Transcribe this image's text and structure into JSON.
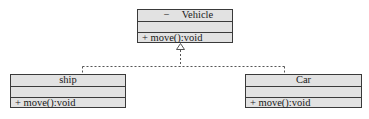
{
  "diagram": {
    "type": "uml-class-diagram",
    "relationship": "realization",
    "colors": {
      "box_fill": "#e2e2e2",
      "box_border": "#3a3a3a",
      "connector": "#555555"
    },
    "classes": [
      {
        "id": "vehicle",
        "visibility": "−",
        "name": "Vehicle",
        "attributes": [],
        "operations": [
          "+ move():void"
        ]
      },
      {
        "id": "ship",
        "name": "ship",
        "attributes": [],
        "operations": [
          "+ move():void"
        ]
      },
      {
        "id": "car",
        "name": "Car",
        "attributes": [],
        "operations": [
          "+ move():void"
        ]
      }
    ],
    "edges": [
      {
        "from": "ship",
        "to": "vehicle",
        "style": "dashed",
        "arrowhead": "hollow-triangle"
      },
      {
        "from": "car",
        "to": "vehicle",
        "style": "dashed",
        "arrowhead": "hollow-triangle"
      }
    ]
  }
}
